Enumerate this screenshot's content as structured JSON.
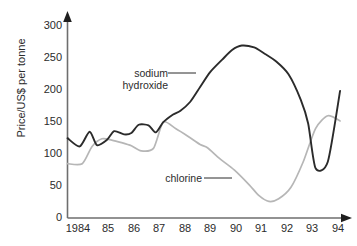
{
  "chart_data": {
    "type": "line",
    "title": "",
    "xlabel": "",
    "ylabel": "Price/US$ per tonne",
    "xlim": [
      1983.4,
      1994.7
    ],
    "ylim": [
      0,
      310
    ],
    "yticks": [
      0,
      50,
      100,
      150,
      200,
      250,
      300
    ],
    "xticks": [
      1984,
      1985,
      1986,
      1987,
      1988,
      1989,
      1990,
      1991,
      1992,
      1993,
      1994
    ],
    "xtick_labels": [
      "1984",
      "85",
      "86",
      "87",
      "88",
      "89",
      "90",
      "91",
      "92",
      "93",
      "94"
    ],
    "grid": false,
    "legend": "annotations-with-leader-lines",
    "series": [
      {
        "name": "sodium hydroxide",
        "color": "#2b2b2b",
        "x": [
          1983.4,
          1983.9,
          1984.3,
          1984.6,
          1985.0,
          1985.3,
          1985.7,
          1986.0,
          1986.3,
          1986.7,
          1987.0,
          1987.3,
          1987.7,
          1988.0,
          1988.4,
          1988.8,
          1989.2,
          1989.7,
          1990.1,
          1990.5,
          1991.0,
          1991.4,
          1991.9,
          1992.4,
          1992.9,
          1993.2,
          1993.5,
          1994.0,
          1994.5
        ],
        "y": [
          125,
          112,
          135,
          114,
          122,
          136,
          131,
          133,
          146,
          145,
          134,
          150,
          162,
          168,
          182,
          205,
          228,
          248,
          263,
          270,
          267,
          258,
          245,
          225,
          185,
          148,
          78,
          88,
          199
        ]
      },
      {
        "name": "chlorine",
        "color": "#b6b6b6",
        "x": [
          1983.4,
          1984.0,
          1984.4,
          1984.8,
          1985.2,
          1985.6,
          1986.0,
          1986.4,
          1986.9,
          1987.3,
          1987.8,
          1988.3,
          1988.8,
          1989.1,
          1989.6,
          1990.2,
          1990.8,
          1991.2,
          1991.6,
          1992.0,
          1992.5,
          1993.0,
          1993.5,
          1994.0,
          1994.5
        ],
        "y": [
          85,
          85,
          112,
          124,
          122,
          118,
          113,
          105,
          109,
          150,
          140,
          128,
          115,
          110,
          93,
          75,
          52,
          35,
          26,
          30,
          48,
          88,
          140,
          160,
          152
        ]
      }
    ],
    "annotations": [
      {
        "text_line1": "sodium",
        "text_line2": "hydroxide",
        "series": "sodium hydroxide"
      },
      {
        "text_line1": "chlorine",
        "text_line2": "",
        "series": "chlorine"
      }
    ]
  },
  "axis": {
    "y_title": "Price/US$ per tonne",
    "y_tick_300": "300",
    "y_tick_250": "250",
    "y_tick_200": "200",
    "y_tick_150": "150",
    "y_tick_100": "100",
    "y_tick_50": "50",
    "y_tick_0": "0",
    "x_tick_1984": "1984",
    "x_tick_1985": "85",
    "x_tick_1986": "86",
    "x_tick_1987": "87",
    "x_tick_1988": "88",
    "x_tick_1989": "89",
    "x_tick_1990": "90",
    "x_tick_1991": "91",
    "x_tick_1992": "92",
    "x_tick_1993": "93",
    "x_tick_1994": "94"
  },
  "labels": {
    "sodium_line1": "sodium",
    "sodium_line2": "hydroxide",
    "chlorine": "chlorine"
  },
  "colors": {
    "sodium_hydroxide": "#2b2b2b",
    "chlorine": "#b6b6b6",
    "axis": "#6e6e6e",
    "text": "#2b2b2b"
  }
}
